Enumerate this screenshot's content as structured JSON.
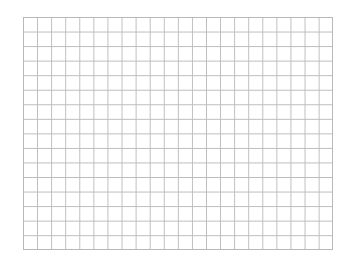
{
  "grid": {
    "columns": 22,
    "rows": 16,
    "line_color": "#bcbcbc",
    "background": "#ffffff"
  }
}
